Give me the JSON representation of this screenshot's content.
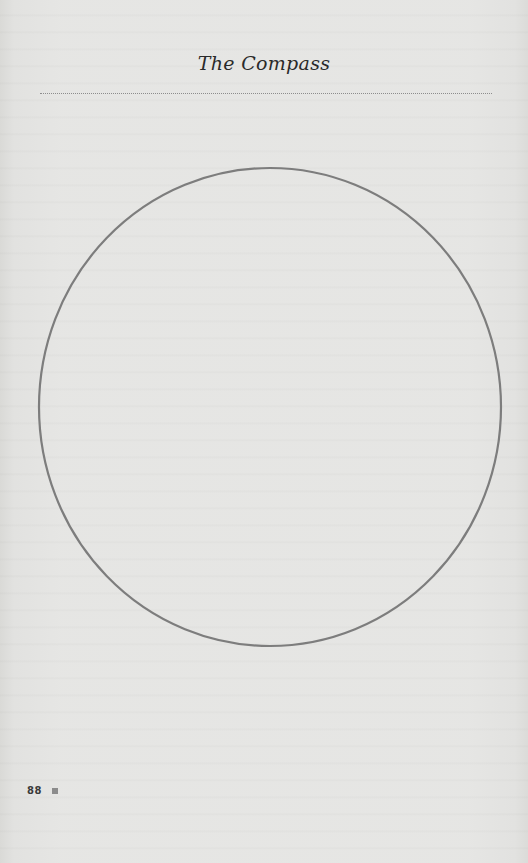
{
  "page": {
    "running_head": "The Compass",
    "page_number": "88",
    "colors": {
      "paper": "#f1f1f0",
      "circle_stroke": "#7d7d7d",
      "rule": "#8d8d8d",
      "folio_square": "#8c8c8c"
    }
  },
  "figure": {
    "shape": "circle"
  }
}
